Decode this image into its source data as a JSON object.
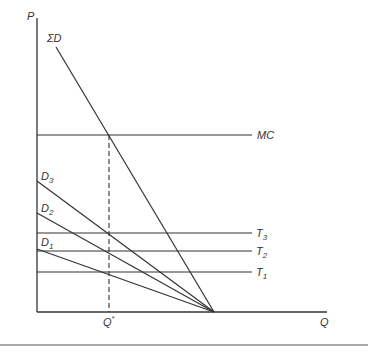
{
  "diagram": {
    "axes": {
      "y_label": "P",
      "x_label": "Q"
    },
    "curves": {
      "sum_demand": {
        "label": "ΣD",
        "sub": ""
      },
      "marginal_cost": {
        "label": "MC"
      },
      "d3": {
        "label": "D",
        "sub": "3"
      },
      "d2": {
        "label": "D",
        "sub": "2"
      },
      "d1": {
        "label": "D",
        "sub": "1"
      },
      "t3": {
        "label": "T",
        "sub": "3"
      },
      "t2": {
        "label": "T",
        "sub": "2"
      },
      "t1": {
        "label": "T",
        "sub": "1"
      }
    },
    "equilibrium": {
      "label": "Q",
      "sup": "*"
    },
    "colors": {
      "line": "#333333"
    }
  }
}
